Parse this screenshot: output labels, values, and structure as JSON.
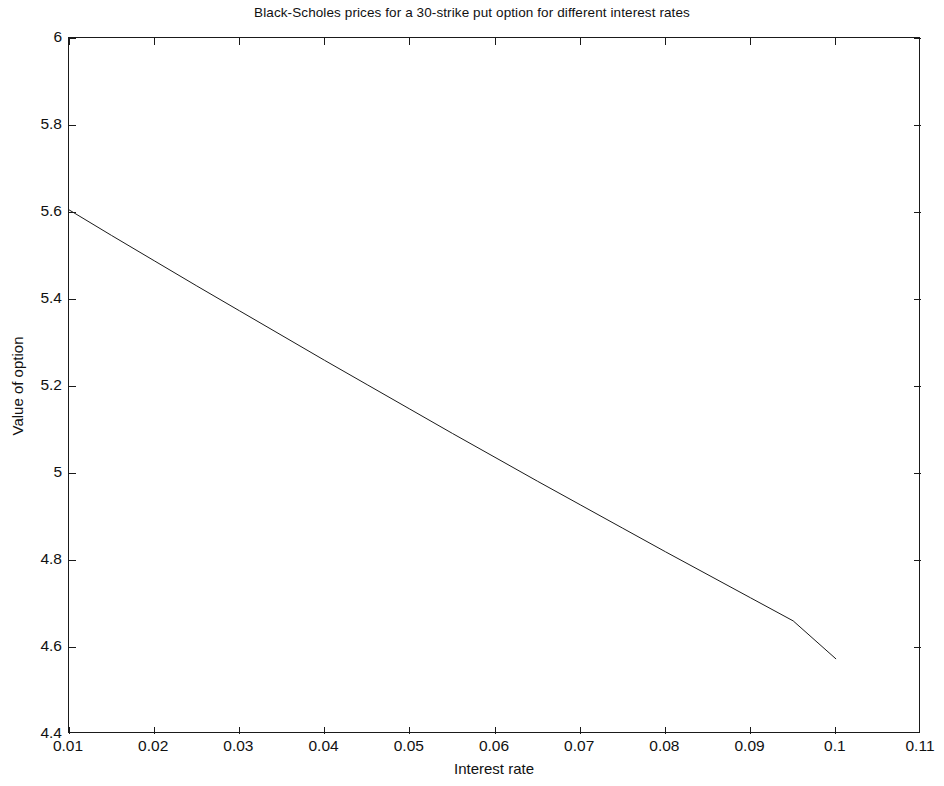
{
  "chart_data": {
    "type": "line",
    "title": "Black-Scholes prices for a 30-strike put option for different interest rates",
    "xlabel": "Interest rate",
    "ylabel": "Value of option",
    "xlim": [
      0.01,
      0.11
    ],
    "ylim": [
      4.4,
      6.0
    ],
    "grid": false,
    "legend": null,
    "legend_position": "none",
    "xticks": [
      "0.01",
      "0.02",
      "0.03",
      "0.04",
      "0.05",
      "0.06",
      "0.07",
      "0.08",
      "0.09",
      "0.1",
      "0.11"
    ],
    "xtick_values": [
      0.01,
      0.02,
      0.03,
      0.04,
      0.05,
      0.06,
      0.07,
      0.08,
      0.09,
      0.1,
      0.11
    ],
    "yticks": [
      "4.4",
      "4.6",
      "4.8",
      "5",
      "5.2",
      "5.4",
      "5.6",
      "5.8",
      "6"
    ],
    "ytick_values": [
      4.4,
      4.6,
      4.8,
      5.0,
      5.2,
      5.4,
      5.6,
      5.8,
      6.0
    ],
    "series": [
      {
        "name": "Black-Scholes put value",
        "color": "#1a1a1a",
        "line_width": 1,
        "x": [
          0.01,
          0.015,
          0.02,
          0.025,
          0.03,
          0.035,
          0.04,
          0.045,
          0.05,
          0.055,
          0.06,
          0.065,
          0.07,
          0.075,
          0.08,
          0.085,
          0.09,
          0.095,
          0.1
        ],
        "y": [
          5.605,
          5.546,
          5.488,
          5.43,
          5.373,
          5.316,
          5.259,
          5.203,
          5.147,
          5.091,
          5.036,
          4.981,
          4.927,
          4.873,
          4.819,
          4.766,
          4.713,
          4.66,
          4.573
        ]
      }
    ]
  },
  "axes": {
    "tick_direction": "in",
    "box": true,
    "axis_color": "#1a1a1a"
  }
}
